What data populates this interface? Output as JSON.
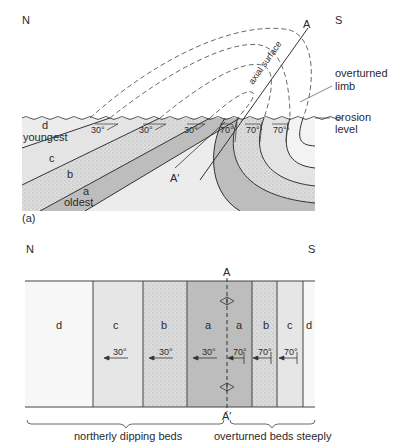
{
  "figure": {
    "part_a": {
      "label": "(a)",
      "compass": {
        "north": "N",
        "south": "S"
      },
      "axial_surface_label": "axial surface",
      "axial_top_label": "A",
      "axial_bottom_label": "A′",
      "overturned_limb_label_line1": "overturned",
      "overturned_limb_label_line2": "limb",
      "erosion_label_line1": "erosion",
      "erosion_label_line2": "level",
      "beds": [
        {
          "id": "d",
          "note": "youngest"
        },
        {
          "id": "c",
          "note": ""
        },
        {
          "id": "b",
          "note": ""
        },
        {
          "id": "a",
          "note": "oldest"
        }
      ],
      "dips_normal": [
        "30°",
        "30°",
        "30°"
      ],
      "dips_overturned": [
        "70°",
        "70°",
        "70°"
      ]
    },
    "part_b": {
      "compass": {
        "north": "N",
        "south": "S"
      },
      "axis_top_label": "A",
      "axis_bottom_label": "A′",
      "columns": [
        {
          "bed": "d",
          "dip": ""
        },
        {
          "bed": "c",
          "dip": "30°"
        },
        {
          "bed": "b",
          "dip": "30°"
        },
        {
          "bed": "a",
          "dip": "30°"
        },
        {
          "bed": "a",
          "dip": "70°"
        },
        {
          "bed": "b",
          "dip": "70°"
        },
        {
          "bed": "c",
          "dip": "70°"
        },
        {
          "bed": "d",
          "dip": ""
        }
      ],
      "brace_left_label": "northerly dipping beds",
      "brace_right_label": "overturned beds steeply"
    },
    "colors": {
      "bed_d": "#f7f7f7",
      "bed_c": "#e6e6e6",
      "bed_b": "#d9d9d9",
      "bed_a": "#bdbdbd",
      "line": "#333333"
    }
  }
}
